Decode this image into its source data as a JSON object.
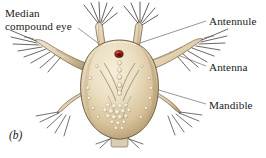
{
  "figure": {
    "caption": "(b)",
    "background_color": "#ffffff"
  },
  "labels": [
    {
      "id": "median-compound-eye",
      "text_line1": "Median",
      "text_line2": "compound eye",
      "position": "upper-left",
      "leader": "diagonal line down-right to red eye spot"
    },
    {
      "id": "antennule",
      "text": "Antennule",
      "position": "upper-right",
      "leader": "long diagonal line down-left to antennule base"
    },
    {
      "id": "antenna",
      "text": "Antenna",
      "position": "middle-right",
      "leader": "diagonal line up-left to antenna shaft"
    },
    {
      "id": "mandible",
      "text": "Mandible",
      "position": "lower-right",
      "leader": "long diagonal line up-left to mandible appendage"
    }
  ],
  "colors": {
    "background": "#ffffff",
    "body_light": "#efe3c8",
    "body_mid": "#ddc9a4",
    "body_shadow": "#b9a277",
    "body_deep_shadow": "#8e7a56",
    "outline": "#5e523c",
    "eye_red": "#9e2318",
    "eye_red_dark": "#5e1008",
    "seta_dark": "#3a3430",
    "leader_line": "#6b6b6b",
    "text": "#1a1a1a",
    "nodule_pale": "#f6eedb"
  },
  "anatomy": {
    "eye_spot": {
      "label": "median compound eye",
      "color": "#9e2318",
      "shape": "small oval",
      "location": "anterior dorsal midline"
    },
    "antennules": {
      "count": 2,
      "description": "paired anterior projections each tipped with a fan of dark setae"
    },
    "antennae": {
      "count": 2,
      "description": "paired lateral biramous limbs with long feathered setae"
    },
    "mandibles": {
      "count": 2,
      "description": "paired posterolateral appendages with bristles"
    },
    "body": {
      "shape": "broad ovoid carapace",
      "texture": "granular with pale rounded nodules and V-shaped midline markings"
    },
    "posterior": {
      "description": "small terminal segment with short bristles at the base"
    }
  }
}
